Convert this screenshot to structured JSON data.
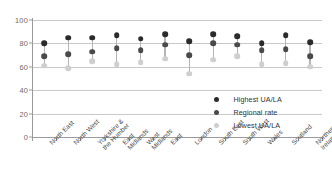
{
  "chart_data": {
    "type": "scatter",
    "title": "",
    "xlabel": "",
    "ylabel": "",
    "ylim": [
      0,
      100
    ],
    "yticks": [
      0,
      20,
      40,
      60,
      80,
      100
    ],
    "grid": true,
    "legend_position": "center-right",
    "categories": [
      "North East",
      "North West",
      "Yorkshire &\nthe Humber",
      "East\nMidlands",
      "West\nMidlands",
      "East",
      "London",
      "South East",
      "South West",
      "Wales",
      "Scotland",
      "Northern\nIreland"
    ],
    "series": [
      {
        "name": "Highest UA/LA",
        "color": "#2b2b2b",
        "values": [
          80,
          85,
          85,
          87,
          84,
          88,
          82,
          88,
          86,
          80,
          87,
          81
        ]
      },
      {
        "name": "Regional rate",
        "color": "#4a4a4a",
        "values": [
          69,
          71,
          73,
          76,
          74,
          79,
          70,
          80,
          79,
          74,
          75,
          69
        ]
      },
      {
        "name": "Lowest UA/LA",
        "color": "#cfcfcf",
        "values": [
          61,
          59,
          65,
          62,
          64,
          67,
          54,
          66,
          69,
          62,
          63,
          60
        ]
      }
    ]
  },
  "legend": {
    "items": [
      {
        "label": "Highest UA/LA",
        "color": "#2b2b2b"
      },
      {
        "label": "Regional rate",
        "color": "#4a4a4a"
      },
      {
        "label": "Lowest UA/LA",
        "color": "#cfcfcf"
      }
    ]
  },
  "axis": {
    "y_tick_labels": [
      "0",
      "20",
      "40",
      "60",
      "80",
      "100"
    ]
  }
}
